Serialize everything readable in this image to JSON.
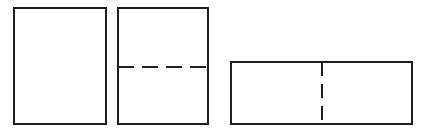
{
  "figure": {
    "title": "",
    "background_color": "#ffffff",
    "stroke_color": "#1f1f1f",
    "canvas": {
      "width": 427,
      "height": 133
    },
    "shapes": [
      {
        "id": "rect-plain",
        "name": "plain-vertical-rectangle",
        "type": "rectangle",
        "x": 14,
        "y": 8,
        "width": 92,
        "height": 116,
        "stroke_width": 2,
        "fill": "none",
        "divider": null
      },
      {
        "id": "rect-horizontal-dashed",
        "name": "vertical-rectangle-with-horizontal-dashed-line",
        "type": "rectangle",
        "x": 118,
        "y": 8,
        "width": 90,
        "height": 116,
        "stroke_width": 2,
        "fill": "none",
        "divider": {
          "orientation": "horizontal",
          "style": "dashed",
          "position": 67,
          "x1": 118,
          "y1": 67,
          "x2": 208,
          "y2": 67,
          "dash_length": 16,
          "gap_length": 8,
          "stroke_width": 2,
          "dash_count": 4
        }
      },
      {
        "id": "rect-vertical-dashed",
        "name": "horizontal-rectangle-with-vertical-dashed-line",
        "type": "rectangle",
        "x": 231,
        "y": 62,
        "width": 181,
        "height": 62,
        "stroke_width": 2,
        "fill": "none",
        "divider": {
          "orientation": "vertical",
          "style": "dashed",
          "position": 322,
          "x1": 322,
          "y1": 62,
          "x2": 322,
          "y2": 124,
          "dash_length": 14,
          "gap_length": 8,
          "stroke_width": 2,
          "dash_count": 3
        }
      }
    ]
  }
}
